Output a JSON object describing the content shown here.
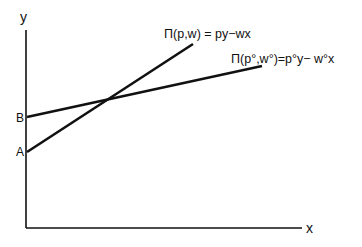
{
  "diagram": {
    "type": "line-diagram",
    "axes": {
      "x_label": "x",
      "y_label": "y"
    },
    "intercepts": [
      {
        "label": "B",
        "on_axis": "y",
        "note": "higher intercept, shallow line"
      },
      {
        "label": "A",
        "on_axis": "y",
        "note": "lower intercept, steep line"
      }
    ],
    "lines": [
      {
        "id": "profit-line-pw",
        "label": "Π(p,w) = py−wx",
        "starts_at": "A",
        "relative_slope": "steeper"
      },
      {
        "id": "profit-line-p0w0",
        "label": "Π(p°,w°)=p°y− w°x",
        "starts_at": "B",
        "relative_slope": "shallower"
      }
    ],
    "colors": {
      "ink": "#111111",
      "background": "#ffffff"
    }
  }
}
